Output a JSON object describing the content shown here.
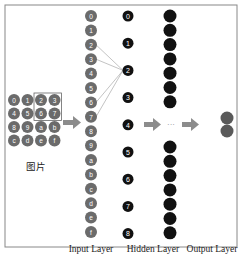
{
  "diagram": {
    "image_caption": "图片",
    "image_grid": {
      "rows": [
        [
          "0",
          "1",
          "2",
          "3"
        ],
        [
          "4",
          "5",
          "6",
          "7"
        ],
        [
          "8",
          "9",
          "a",
          "b"
        ],
        [
          "c",
          "d",
          "e",
          "f"
        ]
      ],
      "highlight": {
        "rows": [
          0,
          1
        ],
        "cols": [
          2,
          3
        ]
      }
    },
    "input_layer": {
      "label": "Input Layer",
      "nodes": [
        "0",
        "1",
        "2",
        "3",
        "4",
        "5",
        "6",
        "7",
        "8",
        "9",
        "a",
        "b",
        "c",
        "d",
        "e",
        "f"
      ]
    },
    "hidden_layer": {
      "label": "Hidden Layer",
      "nodes": [
        "0",
        "1",
        "2",
        "3",
        "4",
        "5",
        "6",
        "7",
        "8"
      ]
    },
    "connections": {
      "from_inputs": [
        "2",
        "3",
        "6",
        "7"
      ],
      "to_hidden": "2"
    },
    "right_column": {
      "top_count": 7,
      "bottom_count": 7
    },
    "ellipsis": "···",
    "output_layer": {
      "label": "Output Layer",
      "count": 2
    },
    "colors": {
      "input_node": "#6b6b6b",
      "hidden_node": "#111111",
      "output_node": "#5a5a5a",
      "arrow": "#8c8c8c",
      "border": "#888888",
      "line": "#9a9a9a"
    }
  }
}
